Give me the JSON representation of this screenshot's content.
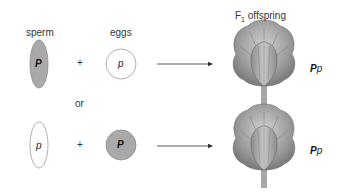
{
  "labels": {
    "sperm": "sperm",
    "eggs": "eggs",
    "or": "or",
    "f1_prefix": "F",
    "f1_sub": "1",
    "f1_suffix": " offspring"
  },
  "cross_1": {
    "sperm_allele": "P",
    "egg_allele": "p",
    "plus": "+",
    "offspring_genotype_dominant": "P",
    "offspring_genotype_recessive": "p"
  },
  "cross_2": {
    "sperm_allele": "p",
    "egg_allele": "P",
    "plus": "+",
    "offspring_genotype_dominant": "P",
    "offspring_genotype_recessive": "p"
  },
  "colors": {
    "dominant_fill": "#a9a9a9",
    "recessive_fill": "#ffffff",
    "outline": "#9a9a9a",
    "flower": "#8f8f8f"
  }
}
